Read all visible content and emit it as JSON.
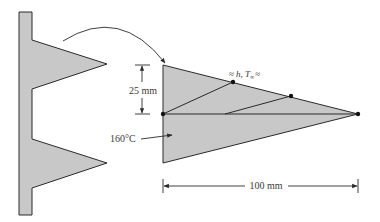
{
  "diagram": {
    "type": "triangular fin array with finite-element nodal network",
    "labels": {
      "height": "25 mm",
      "length": "100 mm",
      "base_temperature": "160°C",
      "convection_prefix": "≈",
      "convection_h": "h",
      "convection_sep": ", ",
      "convection_T": "T",
      "convection_T_sub": "∞",
      "convection_suffix": "≈"
    },
    "colors": {
      "fin_fill": "#c8c8c8",
      "outline": "#2a2a2a",
      "text": "#3a3a3a",
      "background": "#ffffff"
    },
    "nodes": [
      {
        "x": 163,
        "y": 114
      },
      {
        "x": 233,
        "y": 82
      },
      {
        "x": 291,
        "y": 96
      },
      {
        "x": 358,
        "y": 114
      }
    ]
  }
}
